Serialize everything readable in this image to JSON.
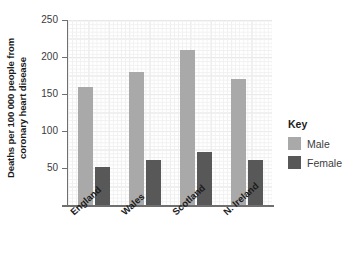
{
  "chart_data": {
    "type": "bar",
    "title": "",
    "xlabel": "",
    "ylabel_line1": "Deaths per 100 000 people from",
    "ylabel_line2": "coronary heart disease",
    "categories": [
      "England",
      "Wales",
      "Scotland",
      "N. Ireland"
    ],
    "series": [
      {
        "name": "Male",
        "color": "#a9a9a9",
        "values": [
          160,
          180,
          210,
          170
        ]
      },
      {
        "name": "Female",
        "color": "#585858",
        "values": [
          51,
          61,
          71,
          61
        ]
      }
    ],
    "ylim": [
      0,
      250
    ],
    "yticks": [
      50,
      100,
      150,
      200,
      250
    ],
    "ytick_labels": [
      "50",
      "100",
      "150",
      "200",
      "250"
    ],
    "grid": true,
    "legend_position": "right",
    "legend_title": "Key"
  }
}
